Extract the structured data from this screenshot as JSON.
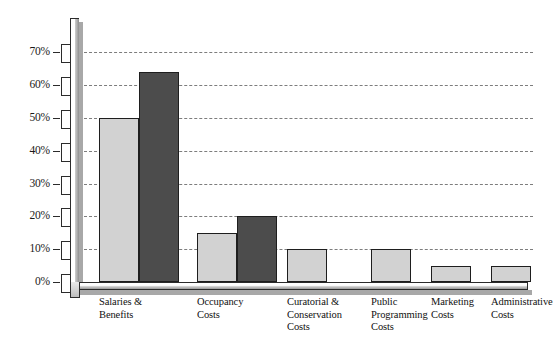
{
  "chart_data": {
    "type": "bar",
    "title": "",
    "subtitle": "",
    "xlabel": "",
    "ylabel": "",
    "ylim": [
      0,
      75
    ],
    "y_ticks": [
      "0%",
      "10%",
      "20%",
      "30%",
      "40%",
      "50%",
      "60%",
      "70%"
    ],
    "y_tick_values": [
      0,
      10,
      20,
      30,
      40,
      50,
      60,
      70
    ],
    "grid": true,
    "grid_style": "dashed-horizontal",
    "legend": "none",
    "categories": [
      "Salaries & Benefits",
      "Occupancy Costs",
      "Curatorial & Conservation Costs",
      "Public Programming Costs",
      "Marketing Costs",
      "Administrative Costs"
    ],
    "category_lines": [
      [
        "Salaries &",
        "Benefits"
      ],
      [
        "Occupancy",
        "Costs"
      ],
      [
        "Curatorial &",
        "Conservation",
        "Costs"
      ],
      [
        "Public",
        "Programming",
        "Costs"
      ],
      [
        "Marketing",
        "Costs"
      ],
      [
        "Administrative",
        "Costs"
      ]
    ],
    "series": [
      {
        "name": "light",
        "color": "#d2d2d2",
        "values": [
          50,
          15,
          10,
          10,
          5,
          5
        ]
      },
      {
        "name": "dark",
        "color": "#4c4c4c",
        "values": [
          64,
          20,
          null,
          null,
          null,
          null
        ]
      }
    ]
  },
  "colors": {
    "light_bar": "#d2d2d2",
    "dark_bar": "#4c4c4c",
    "gridline": "#7d7d7d",
    "axis_line": "#2b2b2b",
    "shadow": "#a8a8a8",
    "background": "#ffffff",
    "text": "#111111"
  }
}
